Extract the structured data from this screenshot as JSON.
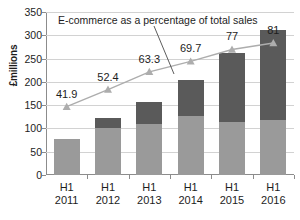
{
  "chart_data": {
    "type": "bar",
    "title": "",
    "annotation": "E-commerce as a percentage of total sales",
    "xlabel": "",
    "ylabel": "£millions",
    "ylim": [
      0,
      350
    ],
    "yticks": [
      0,
      50,
      100,
      150,
      200,
      250,
      300,
      350
    ],
    "grid": true,
    "legend": "none",
    "categories": [
      "H1 2011",
      "H1 2012",
      "H1 2013",
      "H1 2014",
      "H1 2015",
      "H1 2016"
    ],
    "category_lines": [
      [
        "H1",
        "2011"
      ],
      [
        "H1",
        "2012"
      ],
      [
        "H1",
        "2013"
      ],
      [
        "H1",
        "2014"
      ],
      [
        "H1",
        "2015"
      ],
      [
        "H1",
        "2016"
      ]
    ],
    "series": [
      {
        "name": "Lower segment",
        "type": "bar",
        "color": "#9a9a9a",
        "values": [
          78,
          100,
          110,
          127,
          113,
          118
        ]
      },
      {
        "name": "Upper segment",
        "type": "bar",
        "color": "#5a5a5a",
        "values": [
          0,
          23,
          46,
          78,
          148,
          194
        ]
      },
      {
        "name": "E-commerce as a percentage of total sales",
        "type": "line",
        "color": "#adadad",
        "marker": "triangle",
        "axis": "secondary",
        "values": [
          41.9,
          52.4,
          63.3,
          69.7,
          77,
          81
        ],
        "labels": [
          "41.9",
          "52.4",
          "63.3",
          "69.7",
          "77",
          "81"
        ]
      }
    ],
    "bar_totals": [
      78,
      123,
      156,
      205,
      261,
      312
    ]
  },
  "colors": {
    "lower_segment": "#9a9a9a",
    "upper_segment": "#5a5a5a",
    "line": "#adadad",
    "grid": "#d2d2d2",
    "axis": "#8c8c8c",
    "text": "#1d1d1d",
    "background": "#ffffff"
  }
}
